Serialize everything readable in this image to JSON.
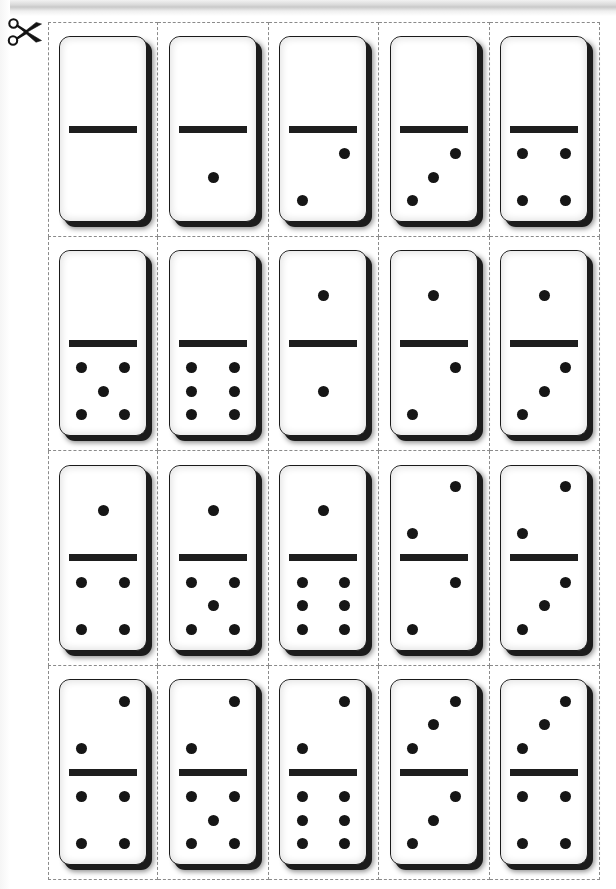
{
  "page": {
    "background_color": "#ffffff",
    "tile_color": "#ffffff",
    "pip_color": "#161616",
    "divider_color": "#1e1e1e",
    "cut_line_color": "#8a8a8a",
    "grid_rows": 4,
    "grid_columns": 5,
    "tile_count": 20
  },
  "cut_marker": {
    "icon": "scissors-icon",
    "label": "cut along dashed lines"
  },
  "tiles": [
    {
      "id": "domino-0-0",
      "top": 0,
      "bottom": 0,
      "row": 1,
      "column": 1
    },
    {
      "id": "domino-0-1",
      "top": 0,
      "bottom": 1,
      "row": 1,
      "column": 2
    },
    {
      "id": "domino-0-2",
      "top": 0,
      "bottom": 2,
      "row": 1,
      "column": 3
    },
    {
      "id": "domino-0-3",
      "top": 0,
      "bottom": 3,
      "row": 1,
      "column": 4
    },
    {
      "id": "domino-0-4",
      "top": 0,
      "bottom": 4,
      "row": 1,
      "column": 5
    },
    {
      "id": "domino-0-5",
      "top": 0,
      "bottom": 5,
      "row": 2,
      "column": 1
    },
    {
      "id": "domino-0-6",
      "top": 0,
      "bottom": 6,
      "row": 2,
      "column": 2
    },
    {
      "id": "domino-1-1",
      "top": 1,
      "bottom": 1,
      "row": 2,
      "column": 3
    },
    {
      "id": "domino-1-2",
      "top": 1,
      "bottom": 2,
      "row": 2,
      "column": 4
    },
    {
      "id": "domino-1-3",
      "top": 1,
      "bottom": 3,
      "row": 2,
      "column": 5
    },
    {
      "id": "domino-1-4",
      "top": 1,
      "bottom": 4,
      "row": 3,
      "column": 1
    },
    {
      "id": "domino-1-5",
      "top": 1,
      "bottom": 5,
      "row": 3,
      "column": 2
    },
    {
      "id": "domino-1-6",
      "top": 1,
      "bottom": 6,
      "row": 3,
      "column": 3
    },
    {
      "id": "domino-2-2",
      "top": 2,
      "bottom": 2,
      "row": 3,
      "column": 4
    },
    {
      "id": "domino-2-3",
      "top": 2,
      "bottom": 3,
      "row": 3,
      "column": 5
    },
    {
      "id": "domino-2-4",
      "top": 2,
      "bottom": 4,
      "row": 4,
      "column": 1
    },
    {
      "id": "domino-2-5",
      "top": 2,
      "bottom": 5,
      "row": 4,
      "column": 2
    },
    {
      "id": "domino-2-6",
      "top": 2,
      "bottom": 6,
      "row": 4,
      "column": 3
    },
    {
      "id": "domino-3-3",
      "top": 3,
      "bottom": 3,
      "row": 4,
      "column": 4
    },
    {
      "id": "domino-3-4",
      "top": 3,
      "bottom": 4,
      "row": 4,
      "column": 5
    }
  ],
  "pip_layouts": {
    "0": [],
    "1": [
      "p-mc"
    ],
    "2": [
      "p-tr",
      "p-bl"
    ],
    "3": [
      "p-tr",
      "p-mc",
      "p-bl"
    ],
    "4": [
      "p-tl",
      "p-tr",
      "p-bl",
      "p-br"
    ],
    "5": [
      "p-tl",
      "p-tr",
      "p-mc",
      "p-bl",
      "p-br"
    ],
    "6": [
      "p-tl",
      "p-tr",
      "p-ml",
      "p-mr",
      "p-bl",
      "p-br"
    ]
  }
}
